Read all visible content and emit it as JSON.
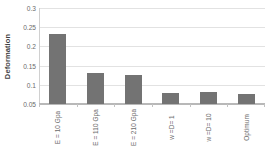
{
  "chart_data": {
    "type": "bar",
    "title": "",
    "xlabel": "",
    "ylabel": "Deformation",
    "categories": [
      "E = 10 Gpa",
      "E = 110 Gpa",
      "E = 210 Gpa",
      "w =D= 1",
      "w =D= 10",
      "Optimum"
    ],
    "values": [
      0.233,
      0.131,
      0.126,
      0.079,
      0.082,
      0.077
    ],
    "ylim": [
      0.05,
      0.3
    ],
    "ytick_labels": [
      "0.05",
      "0.1",
      "0.15",
      "0.2",
      "0.25",
      "0.3"
    ],
    "ytick_values": [
      0.05,
      0.1,
      0.15,
      0.2,
      0.25,
      0.3
    ],
    "grid": true,
    "legend": false,
    "bar_color": "#737373",
    "gridline_color": "#e2e2e2",
    "axis_color": "#b8b8b8",
    "text_color": "#6b6b6b"
  }
}
